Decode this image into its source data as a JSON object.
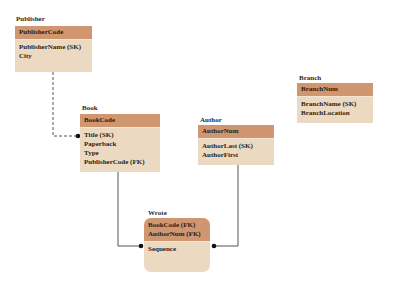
{
  "diagram": {
    "type": "entity-relationship",
    "colors": {
      "header": "#cf9670",
      "body": "#ecd9c2",
      "line": "#555555"
    },
    "entities": [
      {
        "id": "publisher",
        "title": "Publisher",
        "primary_keys": [
          "PublisherCode"
        ],
        "attributes": [
          "PublisherName (SK)",
          "City"
        ]
      },
      {
        "id": "book",
        "title": "Book",
        "primary_keys": [
          "BookCode"
        ],
        "attributes": [
          "Title (SK)",
          "Paperback",
          "Type",
          "PublisherCode (FK)"
        ]
      },
      {
        "id": "author",
        "title": "Author",
        "primary_keys": [
          "AuthorNum"
        ],
        "attributes": [
          "AuthorLast (SK)",
          "AuthorFirst"
        ]
      },
      {
        "id": "branch",
        "title": "Branch",
        "primary_keys": [
          "BranchNum"
        ],
        "attributes": [
          "BranchName (SK)",
          "BranchLocation"
        ]
      },
      {
        "id": "wrote",
        "title": "Wrote",
        "primary_keys": [
          "BookCode (FK)",
          "AuthorNum (FK)"
        ],
        "attributes": [
          "Sequence"
        ]
      }
    ],
    "relationships": [
      {
        "from": "Publisher",
        "to": "Book",
        "style": "dashed",
        "end": "dot"
      },
      {
        "from": "Book",
        "to": "Wrote",
        "style": "solid",
        "end": "dot"
      },
      {
        "from": "Author",
        "to": "Wrote",
        "style": "solid",
        "end": "dot"
      }
    ]
  }
}
